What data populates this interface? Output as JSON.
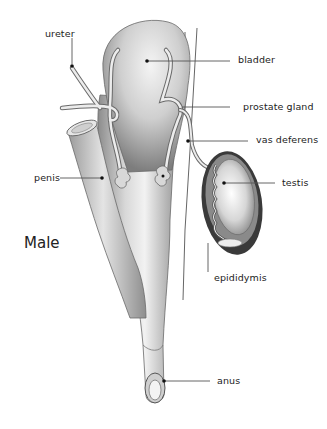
{
  "diagram": {
    "title": "Male",
    "labels": {
      "ureter": "ureter",
      "bladder": "bladder",
      "prostate_gland": "prostate gland",
      "vas_deferens": "vas deferens",
      "penis": "penis",
      "testis": "testis",
      "epididymis": "epididymis",
      "anus": "anus"
    },
    "colors": {
      "organ_light": "#e6e6e6",
      "organ_mid": "#b9b9b9",
      "organ_dark": "#6f6f6f",
      "leader_line": "#555555",
      "text": "#222222"
    }
  }
}
